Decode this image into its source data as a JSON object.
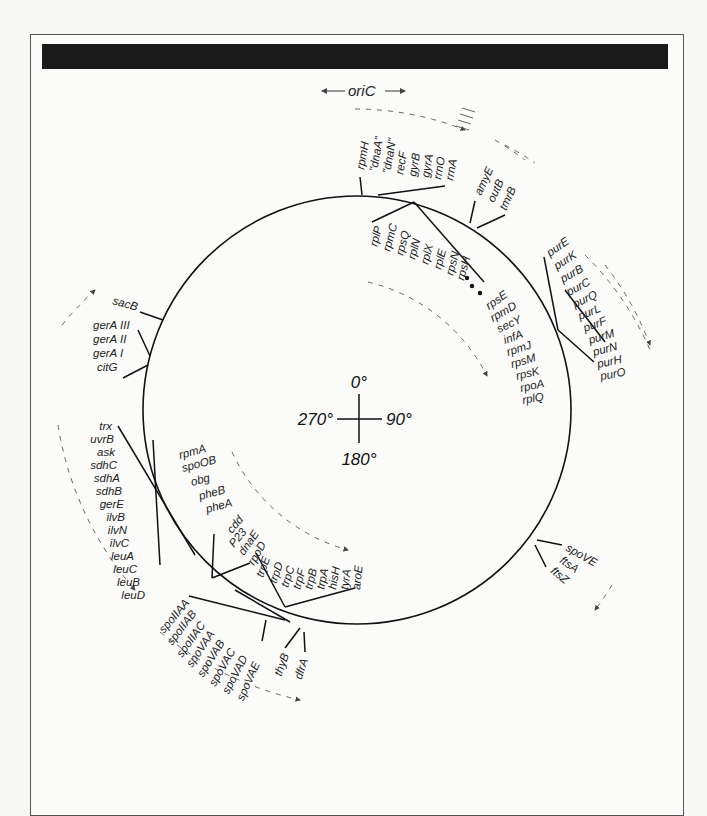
{
  "title_bar": {
    "color": "#1a1a1a",
    "text": ""
  },
  "origin": {
    "label": "oriC",
    "arrows": "← oriC →"
  },
  "compass": {
    "top": "0°",
    "right": "90°",
    "bottom": "180°",
    "left": "270°"
  },
  "clusters": [
    {
      "name": "ori-region",
      "genes": [
        "rpmH",
        "\"dnaA\"",
        "\"dnaN\"",
        "recF",
        "gyrB",
        "gyrA",
        "rrnO",
        "rrnA"
      ]
    },
    {
      "name": "amyE-region",
      "genes": [
        "amyE",
        "outB",
        "tmrB"
      ]
    },
    {
      "name": "ribosomal-region",
      "genes": [
        "rplP",
        "rpmC",
        "rpsQ",
        "rplN",
        "rplX",
        "rplE",
        "rpsN",
        "rpsH",
        "rpsE",
        "rpmD",
        "secY",
        "infA",
        "rpmJ",
        "rpsM",
        "rpsK",
        "rpoA",
        "rplQ"
      ]
    },
    {
      "name": "pur-operon",
      "genes": [
        "purE",
        "purK",
        "purB",
        "purC",
        "purQ",
        "purL",
        "purF",
        "purM",
        "purN",
        "purH",
        "purO"
      ]
    },
    {
      "name": "sacB-region",
      "genes": [
        "sacB"
      ]
    },
    {
      "name": "gerA-region",
      "genes": [
        "gerA III",
        "gerA II",
        "gerA I",
        "citG"
      ]
    },
    {
      "name": "trx-region",
      "genes": [
        "trx",
        "uvrB",
        "ask",
        "sdhC",
        "sdhA",
        "sdhB",
        "gerE",
        "ilvB",
        "ilvN",
        "ilvC",
        "leuA",
        "leuC",
        "leuB",
        "leuD"
      ]
    },
    {
      "name": "spoOB-region",
      "genes": [
        "rpmA",
        "spoOB",
        "obg",
        "pheB",
        "pheA"
      ]
    },
    {
      "name": "cdd-region",
      "genes": [
        "cdd",
        "P23",
        "dnaE",
        "rpoD"
      ]
    },
    {
      "name": "trp-region",
      "genes": [
        "trpE",
        "trpD",
        "trpC",
        "trpF",
        "trpB",
        "trpA",
        "hisH",
        "tyrA",
        "aroE"
      ]
    },
    {
      "name": "spo-region",
      "genes": [
        "spoIIAA",
        "spoIIAB",
        "spoIIAC",
        "spoVAA",
        "spoVAB",
        "spoVAC",
        "spoVAD",
        "spoVAE"
      ]
    },
    {
      "name": "thyB-region",
      "genes": [
        "thyB",
        "dfrA"
      ]
    },
    {
      "name": "spoVE-region",
      "genes": [
        "spoVE",
        "ftsA",
        "ftsZ"
      ]
    }
  ]
}
